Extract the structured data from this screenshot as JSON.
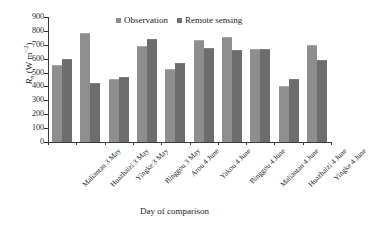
{
  "chart_data": {
    "type": "bar",
    "title": "",
    "xlabel": "Day of comparison",
    "ylabel": "Rn (W m-2)",
    "ylabel_parts": {
      "symbol": "R",
      "subscript": "n",
      "unit_open": " (W m",
      "superscript": "−2",
      "unit_close": ")"
    },
    "ylim": [
      0,
      900
    ],
    "ytick_step": 100,
    "yticks": [
      900,
      800,
      700,
      600,
      500,
      400,
      300,
      200,
      100,
      0
    ],
    "grid": false,
    "legend_position": "top-center",
    "categories": [
      "Maliantan 3 May",
      "Huazhaizi 3 May",
      "Yingke 3 May",
      "Binggou 3 May",
      "Arou 4 June",
      "Yakou 4 June",
      "Binggou 4 June",
      "Maliantan 4 June",
      "Huazhaizi 4 June",
      "Yingke 4 June"
    ],
    "series": [
      {
        "name": "Observation",
        "color": "#8e8e8e",
        "values": [
          548,
          780,
          446,
          682,
          517,
          726,
          748,
          660,
          393,
          690
        ]
      },
      {
        "name": "Remote sensing",
        "color": "#6d6d6d",
        "values": [
          588,
          417,
          462,
          735,
          560,
          669,
          657,
          665,
          443,
          580
        ]
      }
    ]
  },
  "figure": {
    "background": "#ffffff",
    "axis_color": "#3a3a3a"
  }
}
